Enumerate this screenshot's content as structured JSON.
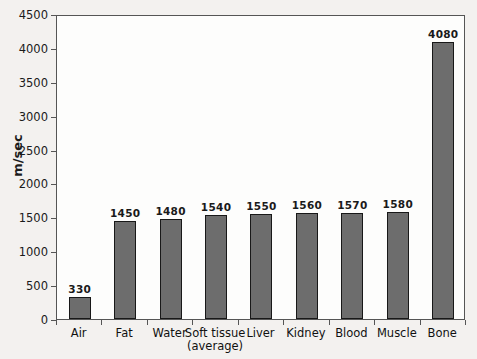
{
  "chart_data": {
    "type": "bar",
    "title": "",
    "xlabel": "",
    "ylabel": "m/sec",
    "ylim": [
      0,
      4500
    ],
    "ytick_step": 500,
    "yticks": [
      0,
      500,
      1000,
      1500,
      2000,
      2500,
      3000,
      3500,
      4000,
      4500
    ],
    "grid": false,
    "legend": "none",
    "bar_color": "#6d6d6d",
    "bar_edge_color": "#181818",
    "categories": [
      "Air",
      "Fat",
      "Water",
      "Soft tissue\n(average)",
      "Liver",
      "Kidney",
      "Blood",
      "Muscle",
      "Bone"
    ],
    "values": [
      330,
      1450,
      1480,
      1540,
      1550,
      1560,
      1570,
      1580,
      4080
    ],
    "value_labels": [
      "330",
      "1450",
      "1480",
      "1540",
      "1550",
      "1560",
      "1570",
      "1580",
      "4080"
    ]
  }
}
